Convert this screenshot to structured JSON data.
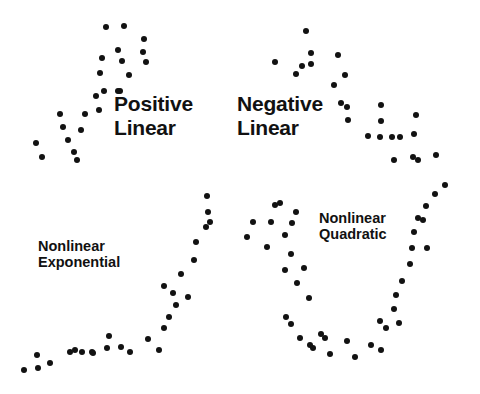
{
  "figure": {
    "width": 480,
    "height": 394,
    "background_color": "#ffffff",
    "dot_color": "#121212",
    "text_color": "#111111",
    "dot_radius_px": 3
  },
  "chart_data": [
    {
      "type": "scatter",
      "title": "Positive Linear",
      "title_lines": [
        "Positive",
        "Linear"
      ],
      "label_position": {
        "x": 114,
        "y": 92
      },
      "label_size": "large",
      "panel": "top-left",
      "xlabel": "",
      "ylabel": "",
      "grid": false,
      "legend": "none",
      "n_points": 24,
      "points": [
        [
          36,
          143
        ],
        [
          42,
          157
        ],
        [
          63,
          127
        ],
        [
          68,
          140
        ],
        [
          74,
          152
        ],
        [
          77,
          160
        ],
        [
          81,
          130
        ],
        [
          60,
          114
        ],
        [
          85,
          114
        ],
        [
          99,
          110
        ],
        [
          96,
          96
        ],
        [
          100,
          73
        ],
        [
          104,
          91
        ],
        [
          118,
          91
        ],
        [
          120,
          91
        ],
        [
          102,
          58
        ],
        [
          106,
          27
        ],
        [
          124,
          26
        ],
        [
          118,
          50
        ],
        [
          122,
          61
        ],
        [
          129,
          75
        ],
        [
          144,
          39
        ],
        [
          143,
          52
        ],
        [
          146,
          62
        ]
      ]
    },
    {
      "type": "scatter",
      "title": "Negative Linear",
      "title_lines": [
        "Negative",
        "Linear"
      ],
      "label_position": {
        "x": 237,
        "y": 92
      },
      "label_size": "large",
      "panel": "top-right",
      "xlabel": "",
      "ylabel": "",
      "grid": false,
      "legend": "none",
      "n_points": 25,
      "points": [
        [
          306,
          31
        ],
        [
          311,
          53
        ],
        [
          275,
          62
        ],
        [
          296,
          74
        ],
        [
          302,
          66
        ],
        [
          311,
          64
        ],
        [
          338,
          55
        ],
        [
          345,
          75
        ],
        [
          334,
          85
        ],
        [
          341,
          103
        ],
        [
          347,
          107
        ],
        [
          348,
          120
        ],
        [
          381,
          105
        ],
        [
          381,
          121
        ],
        [
          368,
          136
        ],
        [
          380,
          137
        ],
        [
          392,
          137
        ],
        [
          400,
          137
        ],
        [
          416,
          115
        ],
        [
          414,
          134
        ],
        [
          413,
          157
        ],
        [
          418,
          160
        ],
        [
          394,
          160
        ],
        [
          436,
          155
        ],
        [
          445,
          185
        ]
      ]
    },
    {
      "type": "scatter",
      "title": "Nonlinear Exponential",
      "title_lines": [
        "Nonlinear",
        "Exponential"
      ],
      "label_position": {
        "x": 38,
        "y": 238
      },
      "label_size": "small",
      "panel": "bottom-left",
      "xlabel": "",
      "ylabel": "",
      "grid": false,
      "legend": "none",
      "n_points": 28,
      "points": [
        [
          24,
          370
        ],
        [
          38,
          368
        ],
        [
          37,
          355
        ],
        [
          50,
          363
        ],
        [
          70,
          352
        ],
        [
          75,
          350
        ],
        [
          82,
          352
        ],
        [
          92,
          352
        ],
        [
          93,
          353
        ],
        [
          107,
          348
        ],
        [
          109,
          336
        ],
        [
          121,
          347
        ],
        [
          130,
          352
        ],
        [
          148,
          339
        ],
        [
          159,
          350
        ],
        [
          164,
          328
        ],
        [
          169,
          317
        ],
        [
          176,
          305
        ],
        [
          173,
          293
        ],
        [
          164,
          286
        ],
        [
          188,
          297
        ],
        [
          181,
          274
        ],
        [
          194,
          260
        ],
        [
          196,
          242
        ],
        [
          206,
          227
        ],
        [
          208,
          212
        ],
        [
          210,
          222
        ],
        [
          207,
          196
        ]
      ]
    },
    {
      "type": "scatter",
      "title": "Nonlinear Quadratic",
      "title_lines": [
        "Nonlinear",
        "Quadratic"
      ],
      "label_position": {
        "x": 319,
        "y": 210
      },
      "label_size": "small",
      "panel": "bottom-right",
      "xlabel": "",
      "ylabel": "",
      "grid": false,
      "legend": "none",
      "n_points": 40,
      "points": [
        [
          247,
          237
        ],
        [
          253,
          222
        ],
        [
          267,
          247
        ],
        [
          271,
          222
        ],
        [
          275,
          205
        ],
        [
          280,
          203
        ],
        [
          285,
          235
        ],
        [
          291,
          254
        ],
        [
          292,
          223
        ],
        [
          296,
          212
        ],
        [
          285,
          270
        ],
        [
          297,
          283
        ],
        [
          304,
          268
        ],
        [
          309,
          298
        ],
        [
          286,
          317
        ],
        [
          291,
          324
        ],
        [
          300,
          338
        ],
        [
          310,
          345
        ],
        [
          313,
          348
        ],
        [
          321,
          334
        ],
        [
          325,
          338
        ],
        [
          330,
          354
        ],
        [
          347,
          341
        ],
        [
          355,
          357
        ],
        [
          371,
          345
        ],
        [
          381,
          350
        ],
        [
          380,
          321
        ],
        [
          386,
          328
        ],
        [
          394,
          309
        ],
        [
          396,
          295
        ],
        [
          399,
          323
        ],
        [
          402,
          281
        ],
        [
          410,
          264
        ],
        [
          412,
          248
        ],
        [
          414,
          232
        ],
        [
          418,
          218
        ],
        [
          423,
          220
        ],
        [
          427,
          248
        ],
        [
          426,
          206
        ],
        [
          435,
          194
        ]
      ]
    }
  ]
}
